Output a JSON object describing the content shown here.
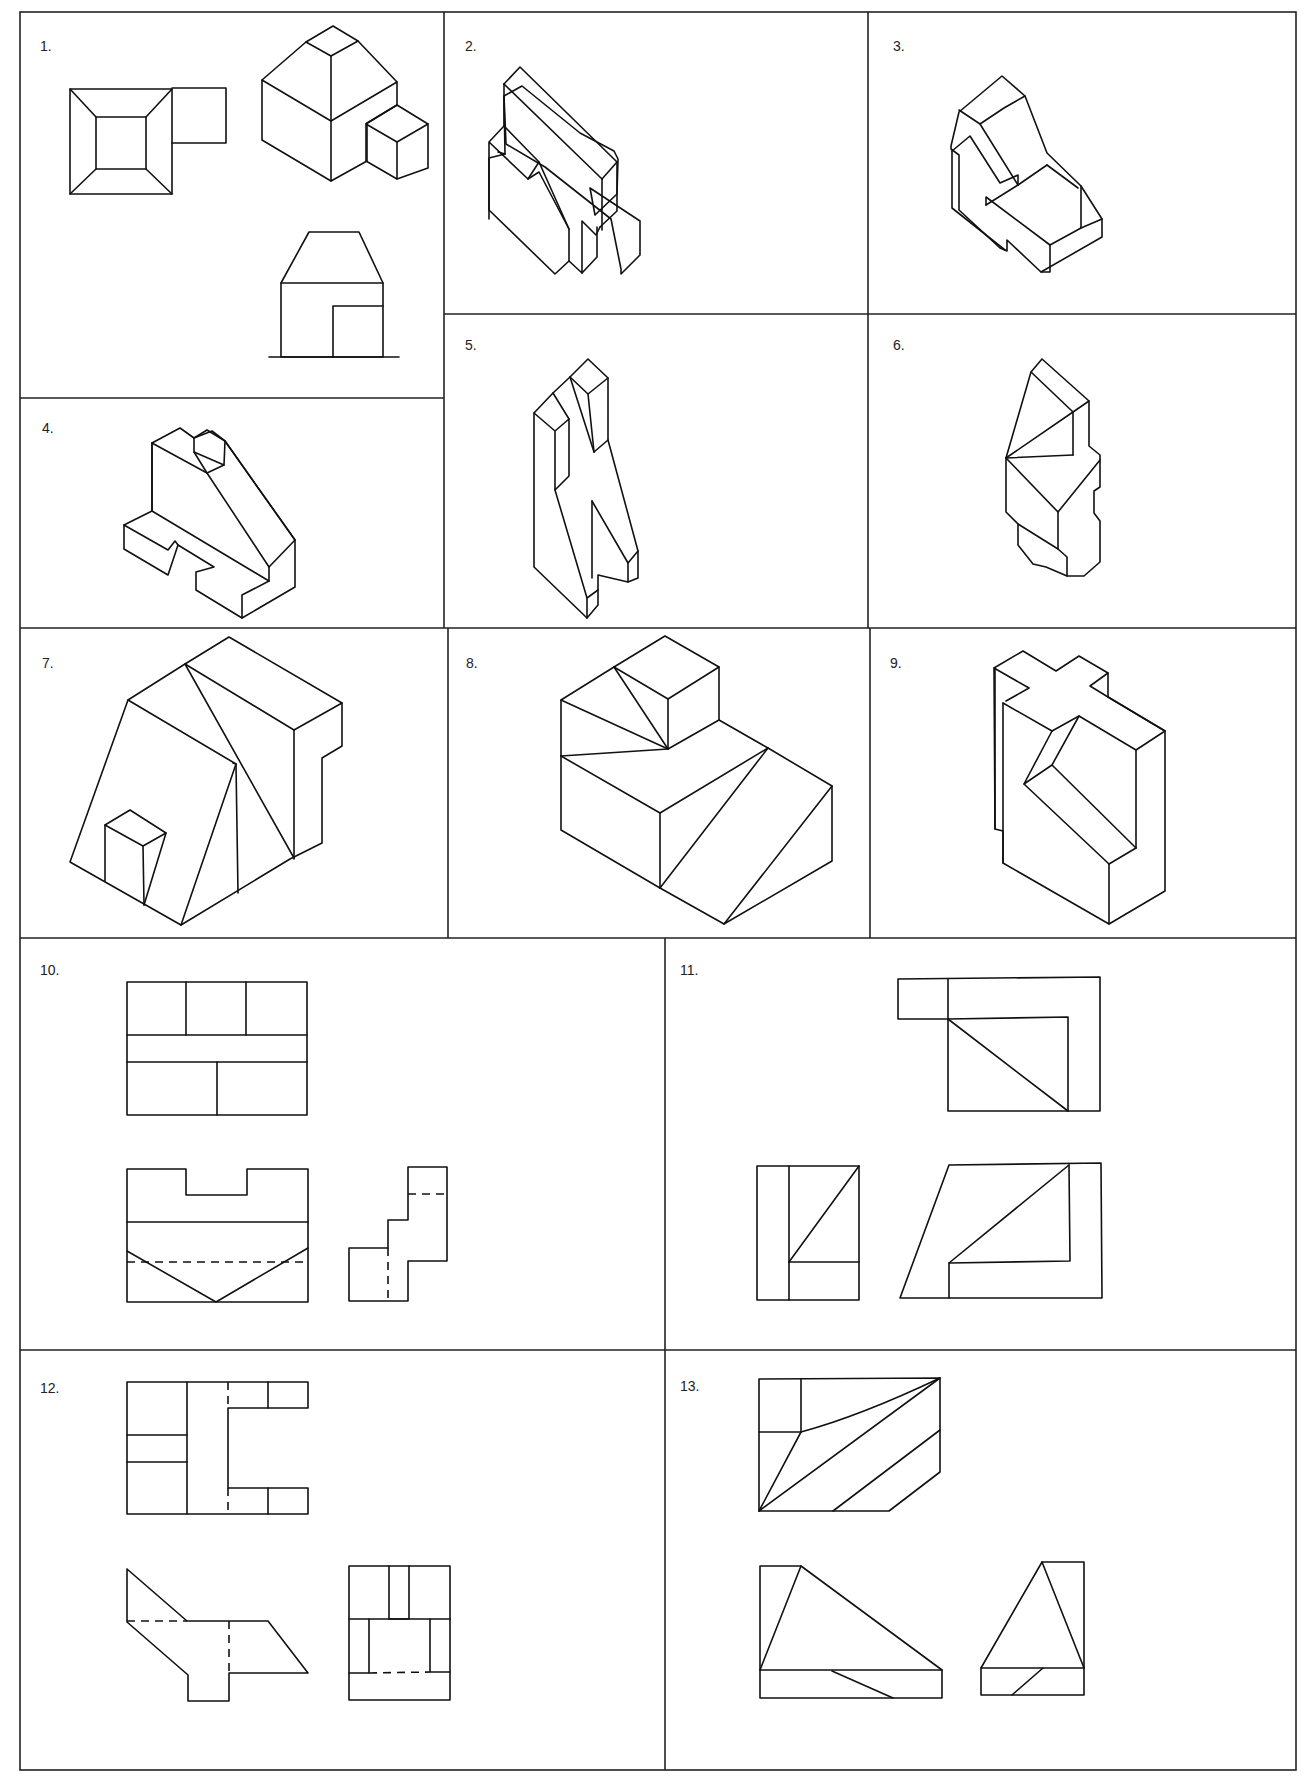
{
  "sheet": {
    "title": "Orthographic and isometric drawing exercises",
    "background": "#ffffff",
    "line_color": "#111111"
  },
  "cells": [
    {
      "id": 1,
      "label": "1.",
      "content": "Two orthographic views (top, front) and isometric of hip-roof block with small cube"
    },
    {
      "id": 2,
      "label": "2.",
      "content": "Isometric drawing of stepped block with sloped face"
    },
    {
      "id": 3,
      "label": "3.",
      "content": "Isometric drawing of stepped block with slanted channel"
    },
    {
      "id": 4,
      "label": "4.",
      "content": "Isometric drawing of block with sloped upright and notched base"
    },
    {
      "id": 5,
      "label": "5.",
      "content": "Isometric drawing of tall notched bracket"
    },
    {
      "id": 6,
      "label": "6.",
      "content": "Isometric drawing of block with triangular faces and stepped base"
    },
    {
      "id": 7,
      "label": "7.",
      "content": "Isometric drawing of sloped block with small prism"
    },
    {
      "id": 8,
      "label": "8.",
      "content": "Isometric drawing of stepped block with cube and sloped faces"
    },
    {
      "id": 9,
      "label": "9.",
      "content": "Isometric drawing of cross-topped block with inclined slot"
    },
    {
      "id": 10,
      "label": "10.",
      "content": "Three orthographic views with hidden lines"
    },
    {
      "id": 11,
      "label": "11.",
      "content": "Three orthographic views with diagonal edges"
    },
    {
      "id": 12,
      "label": "12.",
      "content": "Three orthographic views with hidden lines"
    },
    {
      "id": 13,
      "label": "13.",
      "content": "Three orthographic views with triangular faces"
    }
  ]
}
